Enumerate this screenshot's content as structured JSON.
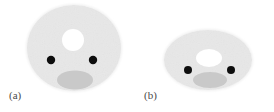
{
  "figure": {
    "background_color": "#ffffff",
    "width": 274,
    "height": 112,
    "disc_color": "#f0f0f0",
    "disc_edge_color": "#e4e4e4",
    "hole_color": "#ffffff",
    "dot_color": "#111111",
    "mouth_color": "#c9c9c9",
    "caption_color": "#4a4a4a",
    "noise": true
  },
  "panels": [
    {
      "id": "a",
      "caption": "(a)",
      "caption_x": 9,
      "caption_y": 89,
      "shape": "near-circular disc",
      "body": {
        "cx": 74,
        "cy": 48,
        "rx": 48,
        "ry": 44
      },
      "hole": {
        "cx": 73,
        "cy": 40,
        "rx": 11,
        "ry": 11
      },
      "dots": [
        {
          "cx": 51,
          "cy": 60,
          "r": 4.2
        },
        {
          "cx": 93,
          "cy": 60,
          "r": 4.2
        }
      ],
      "mouth": {
        "cx": 75,
        "cy": 80,
        "rx": 18,
        "ry": 9.5
      }
    },
    {
      "id": "b",
      "caption": "(b)",
      "caption_x": 144,
      "caption_y": 89,
      "shape": "wide elliptical disc",
      "body": {
        "cx": 208,
        "cy": 60,
        "rx": 45,
        "ry": 31
      },
      "hole": {
        "cx": 209,
        "cy": 58,
        "rx": 13,
        "ry": 9
      },
      "dots": [
        {
          "cx": 188,
          "cy": 70,
          "r": 4.0
        },
        {
          "cx": 231,
          "cy": 70,
          "r": 4.0
        }
      ],
      "mouth": {
        "cx": 210,
        "cy": 80,
        "rx": 17,
        "ry": 8
      }
    }
  ]
}
